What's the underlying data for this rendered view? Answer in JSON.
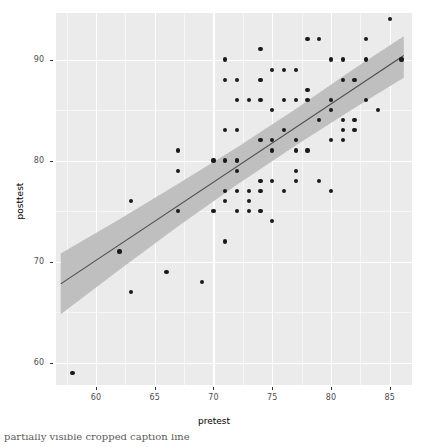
{
  "chart_data": {
    "type": "scatter",
    "title": "",
    "xlabel": "pretest",
    "ylabel": "posttest",
    "xlim": [
      56.6,
      86.9
    ],
    "ylim": [
      57.8,
      94.6
    ],
    "xticks": [
      60,
      65,
      70,
      75,
      80,
      85
    ],
    "yticks": [
      60,
      70,
      80,
      90
    ],
    "grid": true,
    "legend": null,
    "points": [
      [
        58,
        59
      ],
      [
        62,
        71
      ],
      [
        63,
        76
      ],
      [
        63,
        67
      ],
      [
        66,
        69
      ],
      [
        67,
        81
      ],
      [
        67,
        79
      ],
      [
        67,
        75
      ],
      [
        69,
        68
      ],
      [
        70,
        80
      ],
      [
        70,
        75
      ],
      [
        71,
        90
      ],
      [
        71,
        88
      ],
      [
        71,
        83
      ],
      [
        71,
        80
      ],
      [
        71,
        77
      ],
      [
        71,
        76
      ],
      [
        71,
        72
      ],
      [
        72,
        88
      ],
      [
        72,
        86
      ],
      [
        72,
        83
      ],
      [
        72,
        80
      ],
      [
        72,
        79
      ],
      [
        72,
        77
      ],
      [
        72,
        75
      ],
      [
        73,
        86
      ],
      [
        73,
        77
      ],
      [
        73,
        76
      ],
      [
        73,
        75
      ],
      [
        74,
        91
      ],
      [
        74,
        88
      ],
      [
        74,
        86
      ],
      [
        74,
        82
      ],
      [
        74,
        78
      ],
      [
        74,
        77
      ],
      [
        74,
        75
      ],
      [
        75,
        89
      ],
      [
        75,
        85
      ],
      [
        75,
        82
      ],
      [
        75,
        81
      ],
      [
        75,
        78
      ],
      [
        75,
        74
      ],
      [
        76,
        89
      ],
      [
        76,
        86
      ],
      [
        76,
        83
      ],
      [
        76,
        77
      ],
      [
        77,
        89
      ],
      [
        77,
        86
      ],
      [
        77,
        82
      ],
      [
        77,
        81
      ],
      [
        77,
        79
      ],
      [
        77,
        78
      ],
      [
        78,
        92
      ],
      [
        78,
        87
      ],
      [
        78,
        86
      ],
      [
        78,
        81
      ],
      [
        79,
        92
      ],
      [
        79,
        84
      ],
      [
        79,
        78
      ],
      [
        80,
        90
      ],
      [
        80,
        86
      ],
      [
        80,
        85
      ],
      [
        80,
        82
      ],
      [
        80,
        77
      ],
      [
        81,
        95
      ],
      [
        81,
        90
      ],
      [
        81,
        88
      ],
      [
        81,
        84
      ],
      [
        81,
        83
      ],
      [
        81,
        82
      ],
      [
        82,
        88
      ],
      [
        82,
        84
      ],
      [
        82,
        83
      ],
      [
        83,
        97
      ],
      [
        83,
        92
      ],
      [
        83,
        90
      ],
      [
        83,
        86
      ],
      [
        84,
        85
      ],
      [
        85,
        94
      ],
      [
        86,
        90
      ]
    ],
    "fit_line": {
      "type": "linear-regression",
      "x": [
        57.0,
        86.2
      ],
      "y": [
        67.8,
        90.4
      ],
      "color": "#4d4d4d"
    },
    "confidence_band": {
      "level": "0.95",
      "color": "#bfbfbf",
      "x": [
        57.0,
        62.0,
        67.0,
        72.0,
        77.0,
        82.0,
        86.2
      ],
      "lower": [
        64.8,
        69.2,
        73.5,
        77.6,
        81.5,
        85.2,
        88.2
      ],
      "upper": [
        70.8,
        74.2,
        77.7,
        81.3,
        85.1,
        89.1,
        92.3
      ]
    },
    "point_color": "#1a1a1a",
    "panel_background": "#ebebeb",
    "gridline_color": "#ffffff"
  },
  "caption": {
    "text": "partially visible cropped caption line"
  }
}
